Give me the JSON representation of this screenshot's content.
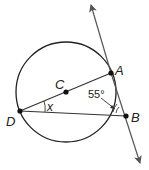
{
  "diagram": {
    "points": {
      "A": {
        "label": "A",
        "x": 111,
        "y": 73
      },
      "B": {
        "label": "B",
        "x": 126,
        "y": 116
      },
      "C": {
        "label": "C",
        "x": 66,
        "y": 92
      },
      "D": {
        "label": "D",
        "x": 20,
        "y": 111
      }
    },
    "circle": {
      "center": "C",
      "radius": 50
    },
    "angles": {
      "x_label": "x",
      "b_label": "55°"
    },
    "colors": {
      "stroke": "#222222",
      "tangent": "#555555"
    }
  }
}
